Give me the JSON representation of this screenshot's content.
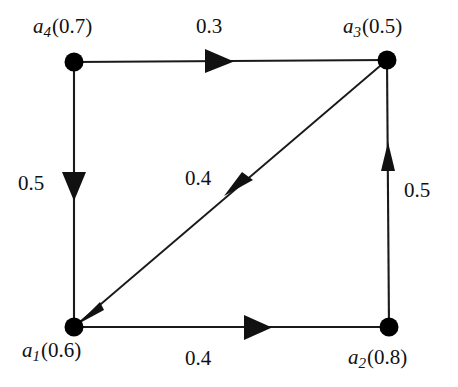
{
  "figure": {
    "type": "directed-weighted-graph",
    "background_color": "#ffffff",
    "stroke_color": "#111111",
    "node_color": "#000000"
  },
  "nodes": [
    {
      "id": "a1",
      "name": "a",
      "subscript": "1",
      "value": "(0.6)",
      "label": "a1(0.6)",
      "x": 74,
      "y": 327,
      "label_position": "below-left"
    },
    {
      "id": "a2",
      "name": "a",
      "subscript": "2",
      "value": "(0.8)",
      "label": "a2(0.8)",
      "x": 389,
      "y": 327,
      "label_position": "below-right"
    },
    {
      "id": "a3",
      "name": "a",
      "subscript": "3",
      "value": "(0.5)",
      "label": "a3(0.5)",
      "x": 387,
      "y": 60,
      "label_position": "above-right"
    },
    {
      "id": "a4",
      "name": "a",
      "subscript": "4",
      "value": "(0.7)",
      "label": "a4(0.7)",
      "x": 74,
      "y": 62,
      "label_position": "above-left"
    }
  ],
  "edges": [
    {
      "id": "e-a4-a3",
      "from": "a4",
      "to": "a3",
      "weight": "0.3",
      "direction": "right",
      "label_position": "above-center"
    },
    {
      "id": "e-a4-a1",
      "from": "a4",
      "to": "a1",
      "weight": "0.5",
      "direction": "down",
      "label_position": "left-center"
    },
    {
      "id": "e-a2-a3",
      "from": "a2",
      "to": "a3",
      "weight": "0.5",
      "direction": "up",
      "label_position": "right-center"
    },
    {
      "id": "e-a1-a2",
      "from": "a1",
      "to": "a2",
      "weight": "0.4",
      "direction": "right",
      "label_position": "below-center"
    },
    {
      "id": "e-a3-a1",
      "from": "a3",
      "to": "a1",
      "weight": "0.4",
      "direction": "down-left",
      "label_position": "center"
    }
  ]
}
